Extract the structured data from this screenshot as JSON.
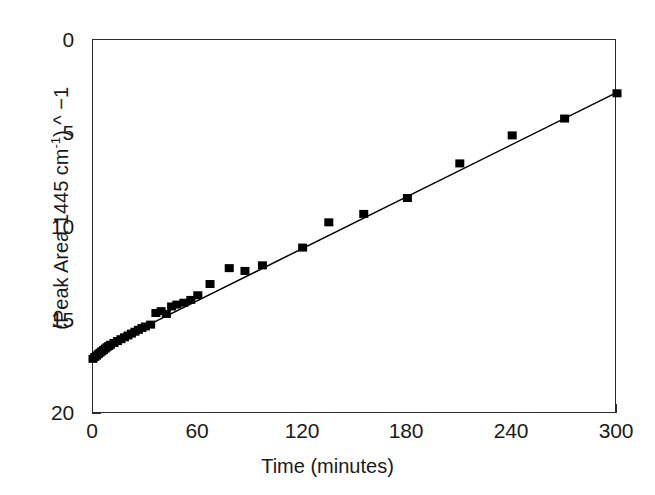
{
  "chart_data": {
    "type": "scatter",
    "title": "",
    "xlabel": "Time (minutes)",
    "ylabel_parts": {
      "prefix": "(Peak Area 1445 cm",
      "superscript": "-1",
      "suffix": ") ^ −1"
    },
    "ylabel": "(Peak Area 1445 cm-1) ^ -1",
    "xlim": [
      0,
      300
    ],
    "ylim": [
      0,
      20
    ],
    "xticks": [
      0,
      60,
      120,
      180,
      240,
      300
    ],
    "yticks": [
      0,
      5,
      10,
      15,
      20
    ],
    "grid": false,
    "legend": null,
    "marker": "filled-square",
    "marker_color": "#000000",
    "line_color": "#000000",
    "series": [
      {
        "name": "Peak area inverse",
        "points": [
          [
            0,
            2.95
          ],
          [
            1,
            3.05
          ],
          [
            2,
            3.12
          ],
          [
            3,
            3.2
          ],
          [
            4,
            3.28
          ],
          [
            5,
            3.35
          ],
          [
            6,
            3.42
          ],
          [
            7,
            3.5
          ],
          [
            8,
            3.57
          ],
          [
            9,
            3.63
          ],
          [
            10,
            3.7
          ],
          [
            12,
            3.8
          ],
          [
            14,
            3.9
          ],
          [
            16,
            4.0
          ],
          [
            18,
            4.1
          ],
          [
            20,
            4.2
          ],
          [
            22,
            4.3
          ],
          [
            24,
            4.4
          ],
          [
            26,
            4.5
          ],
          [
            28,
            4.6
          ],
          [
            30,
            4.68
          ],
          [
            33,
            4.78
          ],
          [
            36,
            5.4
          ],
          [
            39,
            5.5
          ],
          [
            42,
            5.35
          ],
          [
            45,
            5.75
          ],
          [
            48,
            5.85
          ],
          [
            52,
            5.95
          ],
          [
            56,
            6.1
          ],
          [
            60,
            6.35
          ],
          [
            67,
            6.95
          ],
          [
            78,
            7.8
          ],
          [
            87,
            7.65
          ],
          [
            97,
            7.95
          ],
          [
            120,
            8.9
          ],
          [
            135,
            10.25
          ],
          [
            155,
            10.7
          ],
          [
            180,
            11.55
          ],
          [
            210,
            13.4
          ],
          [
            240,
            14.9
          ],
          [
            270,
            15.8
          ],
          [
            300,
            17.15
          ]
        ]
      }
    ],
    "fit_line": {
      "name": "linear fit",
      "x_start": 30,
      "y_start": 4.68,
      "x_end": 300,
      "y_end": 17.2
    },
    "early_curve": {
      "name": "initial rise",
      "points": [
        [
          0,
          2.95
        ],
        [
          3,
          3.2
        ],
        [
          6,
          3.42
        ],
        [
          10,
          3.7
        ],
        [
          15,
          3.95
        ],
        [
          20,
          4.2
        ],
        [
          25,
          4.45
        ],
        [
          30,
          4.68
        ]
      ]
    }
  },
  "axes": {
    "x_tick_labels": [
      "0",
      "60",
      "120",
      "180",
      "240",
      "300"
    ],
    "y_tick_labels": [
      "0",
      "5",
      "10",
      "15",
      "20"
    ]
  }
}
